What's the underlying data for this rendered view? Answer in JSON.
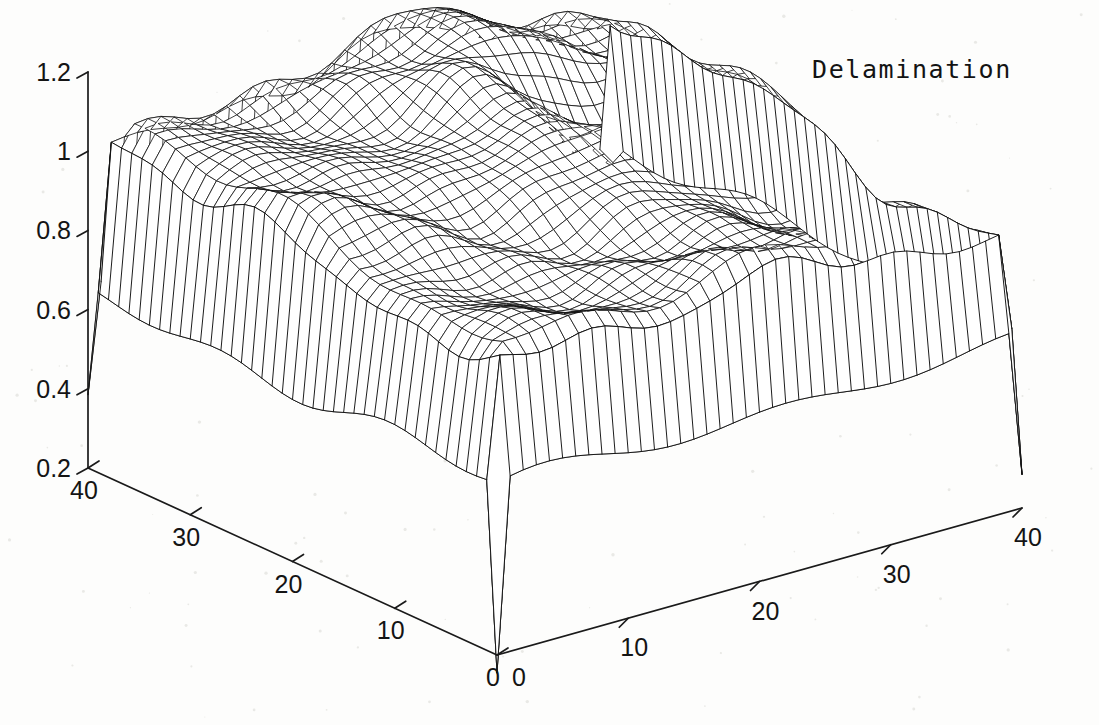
{
  "figure": {
    "title": "Delamination",
    "background_color": "#fdfdfc",
    "line_color": "#111111",
    "width": 1099,
    "height": 725
  },
  "axes": {
    "z": {
      "name": "z-axis",
      "ticks": [
        "1.2",
        "1",
        "0.8",
        "0.6",
        "0.4",
        "0.2"
      ],
      "values": [
        1.2,
        1.0,
        0.8,
        0.6,
        0.4,
        0.2
      ],
      "min": 0.2,
      "max": 1.2,
      "step": 0.2
    },
    "y": {
      "name": "y-axis-left",
      "ticks": [
        "40",
        "30",
        "20",
        "10",
        "0"
      ],
      "values": [
        40,
        30,
        20,
        10,
        0
      ],
      "min": 0,
      "max": 40,
      "step": 10
    },
    "x": {
      "name": "x-axis-right",
      "ticks": [
        "0",
        "10",
        "20",
        "30",
        "40"
      ],
      "values": [
        0,
        10,
        20,
        30,
        40
      ],
      "min": 0,
      "max": 40,
      "step": 10
    }
  },
  "chart_data": {
    "type": "surface",
    "render": "mesh",
    "title": "Delamination",
    "xlabel": "",
    "ylabel": "",
    "zlabel": "",
    "xlim": [
      0,
      40
    ],
    "ylim": [
      0,
      40
    ],
    "zlim": [
      0.2,
      1.2
    ],
    "xticks": [
      0,
      10,
      20,
      30,
      40
    ],
    "yticks": [
      0,
      10,
      20,
      30,
      40
    ],
    "zticks": [
      0.2,
      0.4,
      0.6,
      0.8,
      1.0,
      1.2
    ],
    "grid": false,
    "legend": false,
    "grid_nx": 41,
    "grid_ny": 41,
    "view_azimuth_deg": -37.5,
    "view_elevation_deg": 30,
    "features": [
      {
        "name": "plateau",
        "z_typical": 1.0,
        "region": "central"
      },
      {
        "name": "back-ridge-peak",
        "z_max": 1.18,
        "x": 22,
        "y": 34
      },
      {
        "name": "delamination-crater",
        "z_min": 0.85,
        "center_x": 28,
        "center_y": 26,
        "radius": 5
      },
      {
        "name": "front-skirt-baseline",
        "z_typical": 0.62
      },
      {
        "name": "left-corner-spike",
        "z_min": 0.38
      },
      {
        "name": "front-corner-spike",
        "z_min": 0.15
      },
      {
        "name": "right-corner-spike",
        "z_min": 0.28
      }
    ],
    "surface_z_samples": {
      "note": "Coarse 9x9 sampling of z at x,y = 0,5,10,...,40. Rows are y=0 (front) to y=40 (back).",
      "x": [
        0,
        5,
        10,
        15,
        20,
        25,
        30,
        35,
        40
      ],
      "y": [
        0,
        5,
        10,
        15,
        20,
        25,
        30,
        35,
        40
      ],
      "z": [
        [
          0.38,
          0.6,
          0.62,
          0.63,
          0.61,
          0.6,
          0.62,
          0.6,
          0.15
        ],
        [
          0.62,
          0.95,
          0.97,
          0.98,
          0.96,
          0.95,
          0.96,
          0.94,
          0.6
        ],
        [
          0.64,
          0.98,
          1.02,
          1.03,
          1.01,
          1.0,
          1.0,
          0.97,
          0.62
        ],
        [
          0.66,
          1.0,
          1.05,
          1.07,
          1.05,
          1.02,
          0.98,
          0.99,
          0.63
        ],
        [
          0.67,
          1.02,
          1.07,
          1.09,
          1.08,
          1.03,
          0.92,
          1.0,
          0.64
        ],
        [
          0.68,
          1.04,
          1.09,
          1.12,
          1.11,
          1.06,
          0.96,
          1.01,
          0.64
        ],
        [
          0.68,
          1.05,
          1.11,
          1.15,
          1.14,
          1.1,
          1.06,
          1.02,
          0.63
        ],
        [
          0.66,
          1.04,
          1.1,
          1.16,
          1.18,
          1.13,
          1.08,
          1.01,
          0.61
        ],
        [
          0.28,
          0.62,
          0.64,
          0.66,
          0.67,
          0.65,
          0.63,
          0.6,
          0.28
        ]
      ]
    }
  }
}
